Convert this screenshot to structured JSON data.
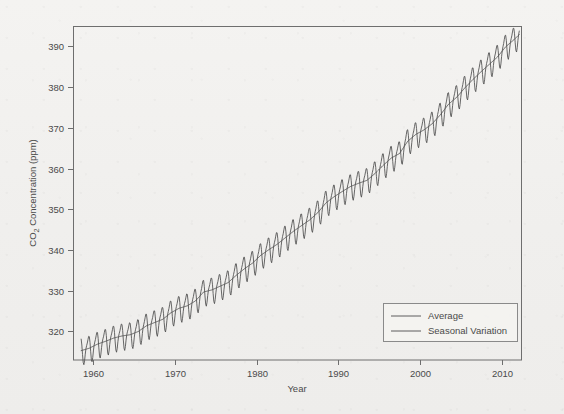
{
  "chart_data": {
    "type": "line",
    "title": "",
    "xlabel": "Year",
    "ylabel": "CO2 Concentration (ppm)",
    "ylabel_parts": {
      "pre": "CO",
      "sub": "2",
      "post": " Concentration (ppm)"
    },
    "xlim": [
      1957.5,
      2012.5
    ],
    "ylim": [
      313,
      395
    ],
    "xticks": [
      1960,
      1970,
      1980,
      1990,
      2000,
      2010
    ],
    "xtick_labels": [
      "1960",
      "1970",
      "1980",
      "1990",
      "2000",
      "2010"
    ],
    "yticks": [
      320,
      330,
      340,
      350,
      360,
      370,
      380,
      390
    ],
    "ytick_labels": [
      "320",
      "330",
      "340",
      "350",
      "360",
      "370",
      "380",
      "390"
    ],
    "grid": false,
    "legend_position": "lower right",
    "legend_entries": [
      "Average",
      "Seasonal Variation"
    ],
    "line_color": "#4d4d4d",
    "frame_color": "#6e6e6e",
    "background_color": "#f2f1ef",
    "seasonal_amplitude_ppm": 3.0,
    "series": [
      {
        "name": "Average",
        "description": "Annual mean CO2 trend (smooth)",
        "x": [
          1958.5,
          1959.5,
          1960.5,
          1961.5,
          1962.5,
          1963.5,
          1964.5,
          1965.5,
          1966.5,
          1967.5,
          1968.5,
          1969.5,
          1970.5,
          1971.5,
          1972.5,
          1973.5,
          1974.5,
          1975.5,
          1976.5,
          1977.5,
          1978.5,
          1979.5,
          1980.5,
          1981.5,
          1982.5,
          1983.5,
          1984.5,
          1985.5,
          1986.5,
          1987.5,
          1988.5,
          1989.5,
          1990.5,
          1991.5,
          1992.5,
          1993.5,
          1994.5,
          1995.5,
          1996.5,
          1997.5,
          1998.5,
          1999.5,
          2000.5,
          2001.5,
          2002.5,
          2003.5,
          2004.5,
          2005.5,
          2006.5,
          2007.5,
          2008.5,
          2009.5,
          2010.5,
          2011.5,
          2012.2
        ],
        "values": [
          315.3,
          315.9,
          316.9,
          317.6,
          318.4,
          318.9,
          319.2,
          320.0,
          321.4,
          322.2,
          323.0,
          324.6,
          325.7,
          326.3,
          327.5,
          329.7,
          330.2,
          331.1,
          332.0,
          333.8,
          335.4,
          336.8,
          338.7,
          340.1,
          341.4,
          343.0,
          344.6,
          346.0,
          347.4,
          349.2,
          351.6,
          353.1,
          354.4,
          355.6,
          356.4,
          357.1,
          358.8,
          360.8,
          362.6,
          363.7,
          366.7,
          368.4,
          369.5,
          371.0,
          373.2,
          375.8,
          377.5,
          379.8,
          381.9,
          383.8,
          385.6,
          387.4,
          389.9,
          391.6,
          393.0
        ]
      },
      {
        "name": "Seasonal Variation",
        "description": "Monthly CO2 with seasonal sawtooth oscillation about the trend, peak in May, minimum in September",
        "peak_month": "May",
        "trough_month": "September",
        "amplitude": 3.0
      }
    ]
  },
  "figure": {
    "plot_area": {
      "left": 73,
      "top": 26,
      "right": 522,
      "bottom": 360
    },
    "legend_box": {
      "left": 383,
      "top": 303,
      "width": 134,
      "height": 38
    }
  }
}
